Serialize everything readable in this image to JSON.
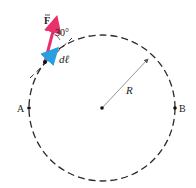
{
  "diagram": {
    "title": "",
    "circle": {
      "cx": 102,
      "cy": 108,
      "r": 73,
      "stroke": "#2a2a2a",
      "dash": "7,4"
    },
    "center_point": {
      "x": 102,
      "y": 108
    },
    "radius_label": "R",
    "point_a": {
      "label": "A",
      "x": 29,
      "y": 108
    },
    "point_b": {
      "label": "B",
      "x": 175,
      "y": 108
    },
    "force_vector": {
      "label": "F",
      "color": "#e8306a",
      "from": [
        45,
        62
      ],
      "to": [
        57,
        15
      ]
    },
    "dl_vector": {
      "label": "dℓ",
      "color": "#2a9fe0",
      "from": [
        45,
        62
      ],
      "to": [
        59,
        47
      ]
    },
    "angle_label": "30°",
    "tangent_line": {
      "from": [
        30,
        78
      ],
      "to": [
        70,
        40
      ]
    }
  }
}
